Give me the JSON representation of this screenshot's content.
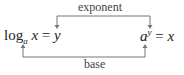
{
  "labels": {
    "top": "exponent",
    "bottom": "base"
  },
  "left_equation": {
    "func": "log",
    "subscript": "a",
    "arg": "x",
    "equals": "=",
    "result": "y"
  },
  "right_equation": {
    "base": "a",
    "exponent": "y",
    "equals": "=",
    "result": "x"
  },
  "colors": {
    "line": "#777777",
    "text": "#222222"
  }
}
